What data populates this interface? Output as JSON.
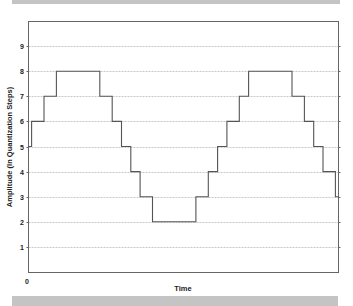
{
  "chart_data": {
    "type": "line",
    "subtype": "step",
    "title": "",
    "xlabel": "Time",
    "ylabel": "Amplitude (In Quantization Steps)",
    "x_tick_labels": [
      "0"
    ],
    "y_tick_labels": [
      "1",
      "2",
      "3",
      "4",
      "5",
      "6",
      "7",
      "8",
      "9"
    ],
    "ylim": [
      0,
      10
    ],
    "grid": "horizontal dotted",
    "legend": null,
    "series": [
      {
        "name": "quantized signal",
        "color": "#555555",
        "steps": [
          {
            "x_start": 0.0,
            "x_end": 0.01,
            "level": 5
          },
          {
            "x_start": 0.01,
            "x_end": 0.05,
            "level": 6
          },
          {
            "x_start": 0.05,
            "x_end": 0.09,
            "level": 7
          },
          {
            "x_start": 0.09,
            "x_end": 0.23,
            "level": 8
          },
          {
            "x_start": 0.23,
            "x_end": 0.27,
            "level": 7
          },
          {
            "x_start": 0.27,
            "x_end": 0.3,
            "level": 6
          },
          {
            "x_start": 0.3,
            "x_end": 0.33,
            "level": 5
          },
          {
            "x_start": 0.33,
            "x_end": 0.36,
            "level": 4
          },
          {
            "x_start": 0.36,
            "x_end": 0.4,
            "level": 3
          },
          {
            "x_start": 0.4,
            "x_end": 0.54,
            "level": 2
          },
          {
            "x_start": 0.54,
            "x_end": 0.58,
            "level": 3
          },
          {
            "x_start": 0.58,
            "x_end": 0.61,
            "level": 4
          },
          {
            "x_start": 0.61,
            "x_end": 0.64,
            "level": 5
          },
          {
            "x_start": 0.64,
            "x_end": 0.68,
            "level": 6
          },
          {
            "x_start": 0.68,
            "x_end": 0.71,
            "level": 7
          },
          {
            "x_start": 0.71,
            "x_end": 0.85,
            "level": 8
          },
          {
            "x_start": 0.85,
            "x_end": 0.89,
            "level": 7
          },
          {
            "x_start": 0.89,
            "x_end": 0.92,
            "level": 6
          },
          {
            "x_start": 0.92,
            "x_end": 0.95,
            "level": 5
          },
          {
            "x_start": 0.95,
            "x_end": 0.99,
            "level": 4
          },
          {
            "x_start": 0.99,
            "x_end": 1.0,
            "level": 3
          }
        ]
      }
    ]
  },
  "colors": {
    "band": "#c4c4c4",
    "frame": "#666666",
    "grid": "#c8c8c8",
    "line": "#555555",
    "text": "#222222"
  }
}
